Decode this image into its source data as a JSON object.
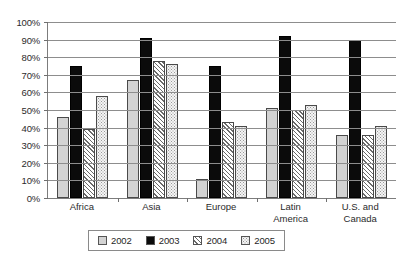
{
  "chart_data": {
    "type": "bar",
    "title": "",
    "xlabel": "",
    "ylabel": "",
    "ylim": [
      0,
      100
    ],
    "ytick_labels": [
      "100%",
      "90%",
      "80%",
      "70%",
      "60%",
      "50%",
      "40%",
      "30%",
      "20%",
      "10%",
      "0%"
    ],
    "ytick_values": [
      100,
      90,
      80,
      70,
      60,
      50,
      40,
      30,
      20,
      10,
      0
    ],
    "grid": true,
    "legend_position": "bottom",
    "categories": [
      "Africa",
      "Asia",
      "Europe",
      "Latin America",
      "U.S. and Canada"
    ],
    "category_labels": [
      "Africa",
      "Asia",
      "Europe",
      "Latin\nAmerica",
      "U.S. and\nCanada"
    ],
    "series": [
      {
        "name": "2002",
        "fill": "light-gray-solid",
        "color": "#d3d3d3",
        "values": [
          46,
          67,
          11,
          51,
          36
        ]
      },
      {
        "name": "2003",
        "fill": "black-solid",
        "color": "#0b0b0b",
        "values": [
          75,
          91,
          75,
          92,
          90
        ]
      },
      {
        "name": "2004",
        "fill": "diagonal-hatch",
        "color": "#ffffff",
        "values": [
          39,
          78,
          43,
          50,
          36
        ]
      },
      {
        "name": "2005",
        "fill": "dotted",
        "color": "#f4f4f4",
        "values": [
          58,
          76,
          41,
          53,
          41
        ]
      }
    ]
  },
  "legend": {
    "items": [
      {
        "label": "2002"
      },
      {
        "label": "2003"
      },
      {
        "label": "2004"
      },
      {
        "label": "2005"
      }
    ]
  }
}
